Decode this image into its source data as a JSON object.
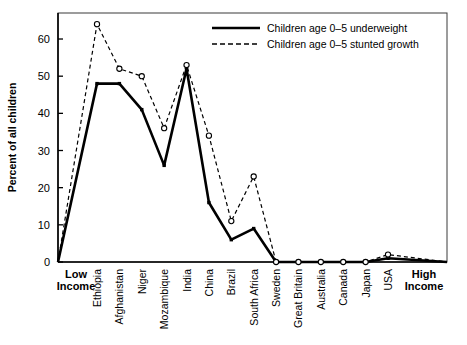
{
  "chart_data": {
    "type": "line",
    "title": "",
    "xlabel": "",
    "ylabel": "Percent of all children",
    "ylim": [
      0,
      67
    ],
    "yticks": [
      0,
      10,
      20,
      30,
      40,
      50,
      60
    ],
    "ytick_labels": [
      "0",
      "10",
      "20",
      "30",
      "40",
      "50",
      "60"
    ],
    "grid": false,
    "legend_position": "top-right",
    "axis_start_label_line1": "Low",
    "axis_start_label_line2": "Income",
    "axis_end_label_line1": "High",
    "axis_end_label_line2": "Income",
    "categories": [
      "Ethiopia",
      "Afghanistan",
      "Niger",
      "Mozambique",
      "India",
      "China",
      "Brazil",
      "South Africa",
      "Sweden",
      "Great Britain",
      "Australia",
      "Canada",
      "Japan",
      "USA"
    ],
    "series": [
      {
        "name": "Children age 0–5 underweight",
        "style": "solid",
        "marker": "square",
        "color": "#000000",
        "values": [
          48,
          48,
          41,
          26,
          52,
          16,
          6,
          9,
          0,
          0,
          0,
          0,
          0,
          1
        ]
      },
      {
        "name": "Children age 0–5 stunted growth",
        "style": "dashed",
        "marker": "open-circle",
        "color": "#000000",
        "values": [
          64,
          52,
          50,
          36,
          53,
          34,
          11,
          23,
          0,
          0,
          0,
          0,
          0,
          2
        ]
      }
    ]
  },
  "legend": {
    "items": [
      {
        "label": "Children age 0–5 underweight"
      },
      {
        "label": "Children age 0–5 stunted growth"
      }
    ]
  }
}
